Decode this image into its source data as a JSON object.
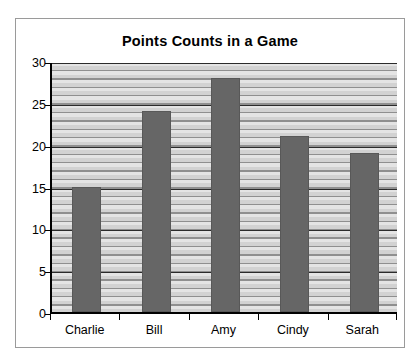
{
  "chart_data": {
    "type": "bar",
    "title": "Points Counts in a Game",
    "xlabel": "",
    "ylabel": "",
    "categories": [
      "Charlie",
      "Bill",
      "Amy",
      "Cindy",
      "Sarah"
    ],
    "values": [
      15,
      24,
      28,
      21,
      19
    ],
    "series": [
      {
        "name": "Points",
        "values": [
          15,
          24,
          28,
          21,
          19
        ]
      }
    ],
    "ylim": [
      0,
      30
    ],
    "y_ticks": [
      0,
      5,
      10,
      15,
      20,
      25,
      30
    ],
    "y_tick_labels": [
      "0",
      "5",
      "10",
      "15",
      "20",
      "25",
      "30"
    ],
    "minor_gridline_step": 1,
    "grid": true,
    "legend": false,
    "legend_position": "none",
    "colors": {
      "bar_fill": "#666666",
      "bar_border": "#585858",
      "plot_background": "#dcdcdc",
      "major_gridline": "#2b2b2b",
      "minor_gridline": "#8f8f8f",
      "axis": "#000000",
      "frame_border": "#9a9a9a",
      "text": "#000000",
      "page_background": "#ffffff"
    }
  }
}
